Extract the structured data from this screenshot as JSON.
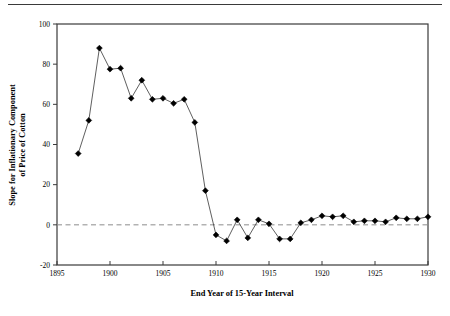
{
  "figure": {
    "top_rule": true,
    "background_color": "#ffffff",
    "line_color": "#4d4d4d",
    "marker_color": "#000000",
    "axis_color": "#3a3a3a",
    "zeroline_color": "#8c8c8c"
  },
  "chart_data": {
    "type": "line",
    "title": "",
    "xlabel": "End Year of 15-Year Interval",
    "ylabel": "Slope for Inflationary Component of Price of Cotton",
    "ylabel_lines": [
      "Slope for Inflationary Component",
      "of Price of Cotton"
    ],
    "xlim": [
      1895,
      1930
    ],
    "ylim": [
      -20,
      100
    ],
    "xticks": [
      1895,
      1900,
      1905,
      1910,
      1915,
      1920,
      1925,
      1930
    ],
    "xtick_labels": [
      "1895",
      "1900",
      "1905",
      "1910",
      "1915",
      "1920",
      "1925",
      "1930"
    ],
    "yticks": [
      -20,
      0,
      20,
      40,
      60,
      80,
      100
    ],
    "ytick_labels": [
      "-20",
      "0",
      "20",
      "40",
      "60",
      "80",
      "100"
    ],
    "grid": false,
    "legend": null,
    "zero_reference_line": 0,
    "marker": "diamond",
    "x": [
      1897,
      1898,
      1899,
      1900,
      1901,
      1902,
      1903,
      1904,
      1905,
      1906,
      1907,
      1908,
      1909,
      1910,
      1911,
      1912,
      1913,
      1914,
      1915,
      1916,
      1917,
      1918,
      1919,
      1920,
      1921,
      1922,
      1923,
      1924,
      1925,
      1926,
      1927,
      1928,
      1929,
      1930
    ],
    "values": [
      35.5,
      52.0,
      88.0,
      77.5,
      78.0,
      63.0,
      72.0,
      62.5,
      63.0,
      60.5,
      62.5,
      51.0,
      17.0,
      -5.0,
      -8.0,
      2.5,
      -6.5,
      2.5,
      0.5,
      -7.0,
      -7.0,
      1.0,
      2.5,
      4.5,
      4.0,
      4.5,
      1.5,
      2.0,
      2.0,
      1.5,
      3.5,
      3.0,
      3.0,
      4.0
    ]
  }
}
